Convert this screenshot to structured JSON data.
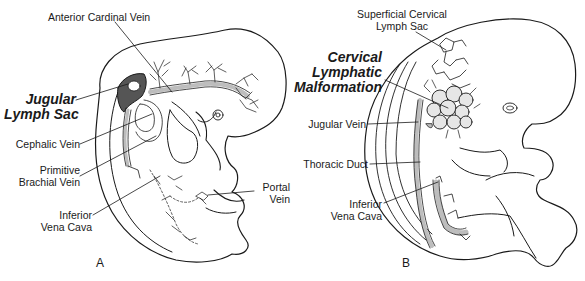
{
  "figure": {
    "panels": [
      {
        "id": "A",
        "label": "A",
        "annotations": {
          "anterior_cardinal_vein": "Anterior Cardinal Vein",
          "jugular_lymph_sac_line1": "Jugular",
          "jugular_lymph_sac_line2": "Lymph Sac",
          "cephalic_vein": "Cephalic Vein",
          "primitive_brachial_vein_line1": "Primitive",
          "primitive_brachial_vein_line2": "Brachial Vein",
          "inferior_vena_cava_line1": "Inferior",
          "inferior_vena_cava_line2": "Vena Cava",
          "portal_vein_line1": "Portal",
          "portal_vein_line2": "Vein"
        }
      },
      {
        "id": "B",
        "label": "B",
        "annotations": {
          "superficial_cervical_lymph_sac_line1": "Superficial Cervical",
          "superficial_cervical_lymph_sac_line2": "Lymph Sac",
          "cervical_lymphatic_malformation_line1": "Cervical",
          "cervical_lymphatic_malformation_line2": "Lymphatic",
          "cervical_lymphatic_malformation_line3": "Malformation",
          "jugular_vein": "Jugular Vein",
          "thoracic_duct": "Thoracic Duct",
          "inferior_vena_cava_line1": "Inferior",
          "inferior_vena_cava_line2": "Vena Cava"
        }
      }
    ]
  },
  "colors": {
    "ink": "#1a1a1a",
    "vessel_fill": "#bdbdbd",
    "sac_fill": "#555555",
    "background": "#ffffff"
  }
}
